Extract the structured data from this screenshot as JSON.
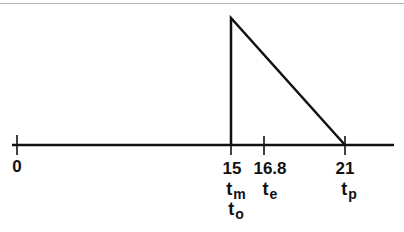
{
  "diagram": {
    "type": "triangular-pulse-timeline",
    "axis": {
      "ticks": [
        {
          "value": "0",
          "symbols": []
        },
        {
          "value": "15",
          "symbols": [
            {
              "base": "t",
              "sub": "m"
            },
            {
              "base": "t",
              "sub": "o"
            }
          ]
        },
        {
          "value": "16.8",
          "symbols": [
            {
              "base": "t",
              "sub": "e"
            }
          ]
        },
        {
          "value": "21",
          "symbols": [
            {
              "base": "t",
              "sub": "p"
            }
          ]
        }
      ]
    },
    "shape": {
      "kind": "right-triangle",
      "rise_at": "15",
      "falls_to_zero_at": "21"
    },
    "labels": {
      "tick_0": "0",
      "tick_15": "15",
      "tick_16_8": "16.8",
      "tick_21": "21",
      "t_m": {
        "base": "t",
        "sub": "m"
      },
      "t_o": {
        "base": "t",
        "sub": "o"
      },
      "t_e": {
        "base": "t",
        "sub": "e"
      },
      "t_p": {
        "base": "t",
        "sub": "p"
      }
    },
    "colors": {
      "stroke": "#111111",
      "background": "#ffffff"
    }
  }
}
